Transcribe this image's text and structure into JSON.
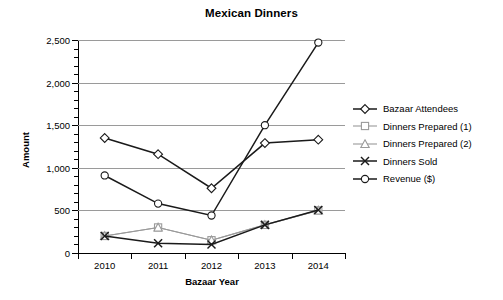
{
  "chart_data": {
    "type": "line",
    "title": "Mexican Dinners",
    "xlabel": "Bazaar Year",
    "ylabel": "Amount",
    "categories": [
      "2010",
      "2011",
      "2012",
      "2013",
      "2014"
    ],
    "ylim": [
      0,
      2500
    ],
    "ytick_labels": [
      "0",
      "500",
      "1,000",
      "1,500",
      "2,000",
      "2,500"
    ],
    "ytick_values": [
      0,
      500,
      1000,
      1500,
      2000,
      2500
    ],
    "ytick_minor_step": 100,
    "grid": "horizontal",
    "legend_position": "right",
    "series": [
      {
        "name": "Bazaar Attendees",
        "marker": "diamond",
        "color": "#1a1a1a",
        "values": [
          1350,
          1160,
          760,
          1290,
          1330
        ]
      },
      {
        "name": "Dinners Prepared (1)",
        "marker": "square",
        "color": "#9a9a9a",
        "values": [
          200,
          300,
          150,
          330,
          500
        ]
      },
      {
        "name": "Dinners Prepared (2)",
        "marker": "triangle",
        "color": "#9a9a9a",
        "values": [
          200,
          300,
          150,
          330,
          500
        ]
      },
      {
        "name": "Dinners Sold",
        "marker": "x",
        "color": "#1a1a1a",
        "values": [
          200,
          115,
          100,
          330,
          505
        ]
      },
      {
        "name": "Revenue ($)",
        "marker": "circle",
        "color": "#1a1a1a",
        "values": [
          910,
          580,
          440,
          1500,
          2470
        ]
      }
    ]
  }
}
